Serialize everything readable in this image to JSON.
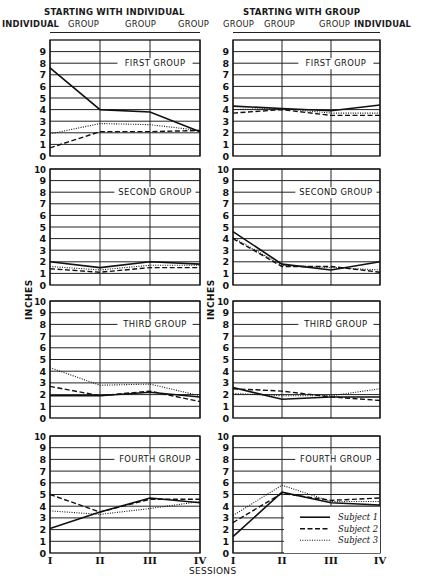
{
  "headers": {
    "left_title": "STARTING WITH INDIVIDUAL",
    "right_title": "STARTING WITH GROUP",
    "left_conditions": [
      "INDIVIDUAL",
      "GROUP",
      "GROUP",
      "GROUP"
    ],
    "right_conditions": [
      "GROUP",
      "GROUP",
      "GROUP",
      "INDIVIDUAL"
    ]
  },
  "axis": {
    "ylabel": "INCHES",
    "xlabel": "SESSIONS",
    "x_ticks": [
      "I",
      "II",
      "III",
      "IV"
    ],
    "y_ticks": [
      0,
      1,
      2,
      3,
      4,
      5,
      6,
      7,
      8,
      9,
      10
    ]
  },
  "legend": [
    {
      "label": "Subject 1",
      "style": "solid"
    },
    {
      "label": "Subject 2",
      "style": "dashed"
    },
    {
      "label": "Subject 3",
      "style": "dotted"
    }
  ],
  "chart_data": {
    "type": "line",
    "title": "",
    "xlabel": "SESSIONS",
    "ylabel": "INCHES",
    "x": [
      "I",
      "II",
      "III",
      "IV"
    ],
    "ylim": [
      0,
      10
    ],
    "grid": true,
    "legend_position": "lower right of bottom-right panel",
    "panels": [
      {
        "column": "STARTING WITH INDIVIDUAL",
        "group": "FIRST GROUP",
        "conditions": [
          "INDIVIDUAL",
          "GROUP",
          "GROUP",
          "GROUP"
        ],
        "series": [
          {
            "name": "Subject 1",
            "values": [
              7.6,
              4.0,
              3.8,
              2.1
            ]
          },
          {
            "name": "Subject 2",
            "values": [
              0.7,
              2.1,
              2.1,
              2.2
            ]
          },
          {
            "name": "Subject 3",
            "values": [
              1.9,
              2.8,
              2.7,
              2.2
            ]
          }
        ]
      },
      {
        "column": "STARTING WITH GROUP",
        "group": "FIRST GROUP",
        "conditions": [
          "GROUP",
          "GROUP",
          "GROUP",
          "INDIVIDUAL"
        ],
        "series": [
          {
            "name": "Subject 1",
            "values": [
              4.3,
              4.1,
              3.9,
              4.4
            ]
          },
          {
            "name": "Subject 2",
            "values": [
              3.7,
              4.0,
              3.5,
              3.5
            ]
          },
          {
            "name": "Subject 3",
            "values": [
              4.0,
              4.1,
              3.7,
              3.7
            ]
          }
        ]
      },
      {
        "column": "STARTING WITH INDIVIDUAL",
        "group": "SECOND GROUP",
        "conditions": [
          "INDIVIDUAL",
          "GROUP",
          "GROUP",
          "GROUP"
        ],
        "series": [
          {
            "name": "Subject 1",
            "values": [
              2.0,
              1.5,
              2.0,
              1.8
            ]
          },
          {
            "name": "Subject 2",
            "values": [
              1.4,
              1.1,
              1.5,
              1.5
            ]
          },
          {
            "name": "Subject 3",
            "values": [
              1.6,
              1.3,
              1.7,
              1.7
            ]
          }
        ]
      },
      {
        "column": "STARTING WITH GROUP",
        "group": "SECOND GROUP",
        "conditions": [
          "GROUP",
          "GROUP",
          "GROUP",
          "INDIVIDUAL"
        ],
        "series": [
          {
            "name": "Subject 1",
            "values": [
              4.6,
              1.8,
              1.3,
              2.0
            ]
          },
          {
            "name": "Subject 2",
            "values": [
              4.0,
              1.6,
              1.6,
              1.1
            ]
          },
          {
            "name": "Subject 3",
            "values": [
              4.1,
              1.7,
              1.5,
              1.3
            ]
          }
        ]
      },
      {
        "column": "STARTING WITH INDIVIDUAL",
        "group": "THIRD GROUP",
        "conditions": [
          "INDIVIDUAL",
          "GROUP",
          "GROUP",
          "GROUP"
        ],
        "series": [
          {
            "name": "Subject 1",
            "values": [
              1.9,
              1.9,
              2.2,
              1.8
            ]
          },
          {
            "name": "Subject 2",
            "values": [
              2.7,
              1.9,
              2.3,
              1.4
            ]
          },
          {
            "name": "Subject 3",
            "values": [
              4.3,
              2.8,
              2.9,
              1.9
            ]
          }
        ]
      },
      {
        "column": "STARTING WITH GROUP",
        "group": "THIRD GROUP",
        "conditions": [
          "GROUP",
          "GROUP",
          "GROUP",
          "INDIVIDUAL"
        ],
        "series": [
          {
            "name": "Subject 1",
            "values": [
              2.6,
              1.6,
              1.8,
              1.8
            ]
          },
          {
            "name": "Subject 2",
            "values": [
              2.5,
              2.3,
              1.8,
              1.5
            ]
          },
          {
            "name": "Subject 3",
            "values": [
              2.1,
              1.9,
              1.9,
              2.5
            ]
          }
        ]
      },
      {
        "column": "STARTING WITH INDIVIDUAL",
        "group": "FOURTH GROUP",
        "conditions": [
          "INDIVIDUAL",
          "GROUP",
          "GROUP",
          "GROUP"
        ],
        "series": [
          {
            "name": "Subject 1",
            "values": [
              2.1,
              3.5,
              4.7,
              4.3
            ]
          },
          {
            "name": "Subject 2",
            "values": [
              5.0,
              3.5,
              4.6,
              4.6
            ]
          },
          {
            "name": "Subject 3",
            "values": [
              3.6,
              3.3,
              3.8,
              4.4
            ]
          }
        ]
      },
      {
        "column": "STARTING WITH GROUP",
        "group": "FOURTH GROUP",
        "conditions": [
          "GROUP",
          "GROUP",
          "GROUP",
          "INDIVIDUAL"
        ],
        "series": [
          {
            "name": "Subject 1",
            "values": [
              1.4,
              5.2,
              4.3,
              4.1
            ]
          },
          {
            "name": "Subject 2",
            "values": [
              2.6,
              5.1,
              4.5,
              4.7
            ]
          },
          {
            "name": "Subject 3",
            "values": [
              3.2,
              5.8,
              4.4,
              4.4
            ]
          }
        ]
      }
    ]
  }
}
